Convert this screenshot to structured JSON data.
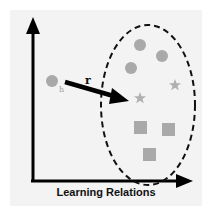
{
  "diagram": {
    "caption": "Learning Relations",
    "relation_label": "r",
    "head_label": "h",
    "colors": {
      "background": "#f3f3f3",
      "axis": "#000000",
      "entity": "#a9a9a9",
      "head_label": "#a0a0a0",
      "ellipse": "#111111"
    },
    "head_entity": {
      "shape": "circle",
      "label": "h"
    },
    "cluster": {
      "circles": 3,
      "stars": 2,
      "squares": 3
    }
  }
}
